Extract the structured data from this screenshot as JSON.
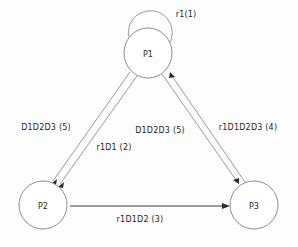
{
  "diagram": {
    "type": "state-transition-graph",
    "background_color": "#fdfdfd",
    "node_stroke_color": "#8d8d8d",
    "edge_color": "#9a9a9a",
    "edge_dark_color": "#3a3a3a",
    "text_color": "#1f1f1f",
    "nodes": [
      {
        "id": "P1",
        "label": "P1",
        "cx": 148,
        "cy": 53,
        "r": 24
      },
      {
        "id": "P2",
        "label": "P2",
        "cx": 43,
        "cy": 205,
        "r": 24
      },
      {
        "id": "P3",
        "label": "P3",
        "cx": 254,
        "cy": 205,
        "r": 24
      }
    ],
    "edges": [
      {
        "id": "self-loop-p1",
        "from": "P1",
        "to": "P1",
        "label": "r1(1)",
        "weight": 1,
        "label_x": 186,
        "label_y": 14
      },
      {
        "id": "p1-to-p2-outer",
        "from": "P1",
        "to": "P2",
        "label": "D1D2D3 (5)",
        "weight": 5,
        "label_x": 46,
        "label_y": 127
      },
      {
        "id": "p1-to-p2-inner",
        "from": "P1",
        "to": "P2",
        "label": "r1D1  (2)",
        "weight": 2,
        "label_x": 114,
        "label_y": 147
      },
      {
        "id": "p1-to-p3",
        "from": "P1",
        "to": "P3",
        "label": "D1D2D3 (5)",
        "weight": 5,
        "label_x": 160,
        "label_y": 130
      },
      {
        "id": "p3-to-p1",
        "from": "P3",
        "to": "P1",
        "label": "r1D1D2D3  (4)",
        "weight": 4,
        "label_x": 248,
        "label_y": 127
      },
      {
        "id": "p2-to-p3",
        "from": "P2",
        "to": "P3",
        "label": "r1D1D2  (3)",
        "weight": 3,
        "label_x": 140,
        "label_y": 219
      }
    ]
  }
}
